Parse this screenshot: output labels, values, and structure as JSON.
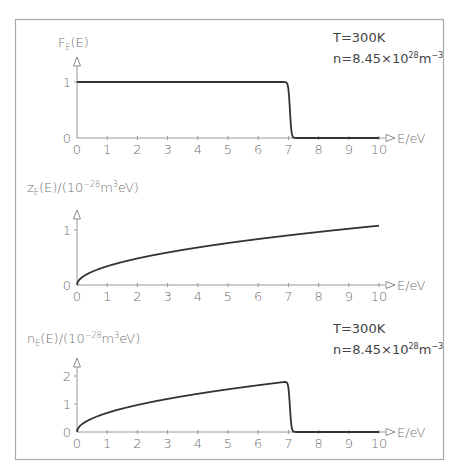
{
  "chart_data": [
    {
      "type": "line",
      "title": "",
      "ylabel": "F_E(E)",
      "xlabel": "E/eV",
      "xlim": [
        0,
        10
      ],
      "ylim": [
        0,
        1.1
      ],
      "x_ticks": [
        "0",
        "1",
        "2",
        "3",
        "4",
        "5",
        "6",
        "7",
        "8",
        "9",
        "10"
      ],
      "y_ticks": [
        "0",
        "1"
      ],
      "grid": false,
      "annotations": [
        "T=300K",
        "n=8.45×10²⁸m⁻³"
      ],
      "series": [
        {
          "name": "Fermi-Dirac distribution",
          "function": "fermi",
          "E_F": 7.05,
          "kT": 0.02585,
          "x": [
            0,
            1,
            2,
            3,
            4,
            5,
            6,
            6.8,
            6.9,
            7.0,
            7.05,
            7.1,
            7.2,
            7.3,
            8,
            9,
            10
          ],
          "values": [
            1,
            1,
            1,
            1,
            1,
            1,
            1,
            1,
            0.98,
            0.88,
            0.5,
            0.12,
            0.003,
            0,
            0,
            0,
            0
          ]
        }
      ]
    },
    {
      "type": "line",
      "title": "",
      "ylabel": "z_E(E)/(10⁻²⁸m³eV)",
      "xlabel": "E/eV",
      "xlim": [
        0,
        10
      ],
      "ylim": [
        0,
        1.3
      ],
      "x_ticks": [
        "0",
        "1",
        "2",
        "3",
        "4",
        "5",
        "6",
        "7",
        "8",
        "9",
        "10"
      ],
      "y_ticks": [
        "0",
        "1"
      ],
      "grid": false,
      "series": [
        {
          "name": "Density of states",
          "function": "sqrt",
          "coef": 0.341,
          "x": [
            0,
            1,
            2,
            3,
            4,
            5,
            6,
            7,
            8,
            9,
            10
          ],
          "values": [
            0,
            0.34,
            0.48,
            0.59,
            0.68,
            0.76,
            0.84,
            0.9,
            0.96,
            1.02,
            1.08
          ]
        }
      ]
    },
    {
      "type": "line",
      "title": "",
      "ylabel": "n_E(E)/(10⁻²⁸m³eV)",
      "xlabel": "E/eV",
      "xlim": [
        0,
        10
      ],
      "ylim": [
        0,
        2.5
      ],
      "x_ticks": [
        "0",
        "1",
        "2",
        "3",
        "4",
        "5",
        "6",
        "7",
        "8",
        "9",
        "10"
      ],
      "y_ticks": [
        "0",
        "1",
        "2"
      ],
      "grid": false,
      "annotations": [
        "T=300K",
        "n=8.45×10²⁸m⁻³"
      ],
      "series": [
        {
          "name": "Occupied state density",
          "function": "sqrt_fermi",
          "coef": 0.682,
          "E_F": 7.05,
          "kT": 0.02585,
          "x": [
            0,
            1,
            2,
            3,
            4,
            5,
            6,
            6.9,
            7.0,
            7.1,
            7.2,
            8,
            9,
            10
          ],
          "values": [
            0,
            0.68,
            0.96,
            1.18,
            1.36,
            1.53,
            1.67,
            1.76,
            1.6,
            0.22,
            0,
            0,
            0,
            0
          ]
        }
      ]
    }
  ],
  "panels": [
    {
      "ylabel_main": "F",
      "ylabel_sub": "E",
      "ylabel_rest": "(E)",
      "xlabel": "E/eV",
      "annotation1": "T=300K",
      "annotation2_main": "n=8.45×10",
      "annotation2_exp": "28",
      "annotation2_unit": "m",
      "annotation2_unit_exp": "−3"
    },
    {
      "ylabel_main": "z",
      "ylabel_sub": "E",
      "ylabel_rest": "(E)/(10",
      "ylabel_exp": "−28",
      "ylabel_unit": "m",
      "ylabel_unit_exp": "3",
      "ylabel_end": "eV)",
      "xlabel": "E/eV"
    },
    {
      "ylabel_main": "n",
      "ylabel_sub": "E",
      "ylabel_rest": "(E)/(10",
      "ylabel_exp": "−28",
      "ylabel_unit": "m",
      "ylabel_unit_exp": "3",
      "ylabel_end": "eV)",
      "xlabel": "E/eV",
      "annotation1": "T=300K",
      "annotation2_main": "n=8.45×10",
      "annotation2_exp": "28",
      "annotation2_unit": "m",
      "annotation2_unit_exp": "−3"
    }
  ],
  "colors": {
    "curve": "#333333",
    "axis": "#9a9a9a",
    "frame": "#a9a9a9",
    "text": "#6f6f6f"
  }
}
